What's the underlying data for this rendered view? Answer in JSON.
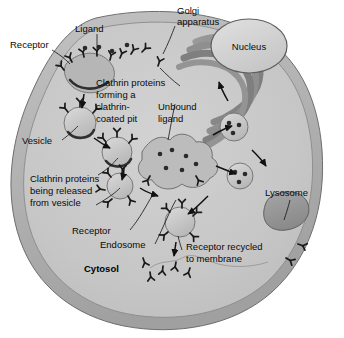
{
  "figure": {
    "background_color": "#ffffff",
    "palette": {
      "cell_membrane": "#b3b3b3",
      "cytosol": "#c9c9c9",
      "organelle_mid": "#a8a8a8",
      "organelle_dark": "#8d8d8d",
      "nucleus_fill": "#d5d5d5",
      "lysosome_fill": "#9a9a9a",
      "outline": "#6e6e6e",
      "label_text": "#0a0a0a"
    }
  },
  "labels": {
    "receptor_top": "Receptor",
    "ligand": "Ligand",
    "golgi": "Golgi\napparatus",
    "golgi_line1": "Golgi",
    "golgi_line2": "apparatus",
    "nucleus": "Nucleus",
    "clathrin_pit_line1": "Clathrin proteins",
    "clathrin_pit_line2": "forming a",
    "clathrin_pit_line3": "clathrin-",
    "clathrin_pit_line4": "coated pit",
    "unbound_line1": "Unbound",
    "unbound_line2": "ligand",
    "vesicle": "Vesicle",
    "released_line1": "Clathrin proteins",
    "released_line2": "being released",
    "released_line3": "from vesicle",
    "receptor_mid": "Receptor",
    "endosome": "Endosome",
    "cytosol": "Cytosol",
    "lysosome": "Lysosome",
    "recycled_line1": "Receptor recycled",
    "recycled_line2": "to membrane"
  },
  "structures": [
    {
      "name": "cell-membrane",
      "kind": "boundary"
    },
    {
      "name": "cytosol",
      "kind": "compartment"
    },
    {
      "name": "nucleus",
      "kind": "organelle"
    },
    {
      "name": "golgi-apparatus",
      "kind": "organelle",
      "cisternae": 4
    },
    {
      "name": "clathrin-coated-pit",
      "kind": "membrane-region"
    },
    {
      "name": "coated-vesicle",
      "kind": "vesicle",
      "count": 3
    },
    {
      "name": "endosome",
      "kind": "organelle"
    },
    {
      "name": "transport-vesicle",
      "kind": "vesicle",
      "count": 2
    },
    {
      "name": "lysosome",
      "kind": "organelle"
    },
    {
      "name": "recycling-vesicle",
      "kind": "vesicle"
    },
    {
      "name": "receptor-glyph",
      "kind": "protein"
    },
    {
      "name": "ligand-glyph",
      "kind": "molecule"
    }
  ]
}
